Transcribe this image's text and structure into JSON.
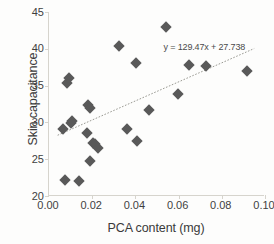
{
  "chart_data": {
    "type": "scatter",
    "title": "",
    "xlabel": "PCA content (mg)",
    "ylabel": "Skin capacitance",
    "xlim": [
      0.0,
      0.1
    ],
    "ylim": [
      20,
      45
    ],
    "xticks": [
      "0.00",
      "0.02",
      "0.04",
      "0.06",
      "0.08",
      "0.10"
    ],
    "xtick_values": [
      0.0,
      0.02,
      0.04,
      0.06,
      0.08,
      0.1
    ],
    "yticks": [
      "20",
      "25",
      "30",
      "35",
      "40",
      "45"
    ],
    "ytick_values": [
      20,
      25,
      30,
      35,
      40,
      45
    ],
    "grid": false,
    "legend": "none",
    "marker_color": "#595959",
    "marker_shape": "diamond",
    "trendline": {
      "equation_text": "y = 129.47x + 27.738",
      "slope": 129.47,
      "intercept": 27.738,
      "style": "dotted",
      "color": "#9a9a93",
      "x_start": 0.004,
      "x_end": 0.095
    },
    "points": [
      {
        "x": 0.0065,
        "y": 29.1
      },
      {
        "x": 0.0075,
        "y": 22.2
      },
      {
        "x": 0.0085,
        "y": 35.4
      },
      {
        "x": 0.0092,
        "y": 36.1
      },
      {
        "x": 0.01,
        "y": 29.9
      },
      {
        "x": 0.0108,
        "y": 30.2
      },
      {
        "x": 0.0138,
        "y": 22.0
      },
      {
        "x": 0.0175,
        "y": 28.5
      },
      {
        "x": 0.0182,
        "y": 32.3
      },
      {
        "x": 0.0188,
        "y": 31.9
      },
      {
        "x": 0.0192,
        "y": 24.8
      },
      {
        "x": 0.0205,
        "y": 27.2
      },
      {
        "x": 0.0215,
        "y": 27.1
      },
      {
        "x": 0.0228,
        "y": 26.5
      },
      {
        "x": 0.0325,
        "y": 40.4
      },
      {
        "x": 0.0362,
        "y": 29.1
      },
      {
        "x": 0.0402,
        "y": 38.1
      },
      {
        "x": 0.0408,
        "y": 27.5
      },
      {
        "x": 0.0462,
        "y": 31.7
      },
      {
        "x": 0.0542,
        "y": 42.9
      },
      {
        "x": 0.0598,
        "y": 33.8
      },
      {
        "x": 0.0648,
        "y": 37.8
      },
      {
        "x": 0.0725,
        "y": 37.6
      },
      {
        "x": 0.0918,
        "y": 37.0
      }
    ]
  }
}
